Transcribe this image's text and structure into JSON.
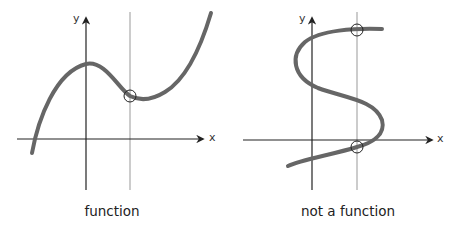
{
  "colors": {
    "curve": "#666666",
    "axis": "#222222",
    "test_line": "#999999",
    "circle": "#222222",
    "background": "#ffffff"
  },
  "panels": [
    {
      "id": "function",
      "caption": "function",
      "x_axis_label": "x",
      "y_axis_label": "y",
      "vertical_line_intersections": 1,
      "description": "Cubic curve: a vertical line crosses the graph at exactly one point"
    },
    {
      "id": "not-a-function",
      "caption": "not a function",
      "x_axis_label": "x",
      "y_axis_label": "y",
      "vertical_line_intersections": 2,
      "description": "S-shaped curve: a vertical line crosses the graph at two points"
    }
  ]
}
